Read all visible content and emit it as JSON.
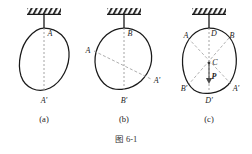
{
  "figure": {
    "caption": "图 6-1",
    "background_color": "#ffffff",
    "stroke_color": "#1a1a1a",
    "dash_color": "#8a8a8a",
    "width": 252,
    "height": 154
  },
  "panels": [
    {
      "id": "a",
      "caption": "(a)",
      "caption_x": 44,
      "caption_y": 114,
      "center_x": 44,
      "support": {
        "x": 44,
        "hatch_y": 8,
        "hatch_w": 34,
        "hatch_h": 6,
        "rod_top": 14,
        "rod_bottom": 28
      },
      "body_path": "M 44 28 C 58 28 68 38 69 52 C 70 66 62 82 50 88 C 38 94 25 88 21 76 C 17 63 21 46 29 37 C 34 31 39 28 44 28 Z",
      "axis": {
        "x1": 44,
        "y1": 28,
        "x2": 44,
        "y2": 90
      },
      "points": [
        {
          "label": "A",
          "x": 50,
          "y": 33
        },
        {
          "label": "A'",
          "x": 44,
          "y": 100
        }
      ]
    },
    {
      "id": "b",
      "caption": "(b)",
      "caption_x": 124,
      "caption_y": 114,
      "center_x": 124,
      "support": {
        "x": 124,
        "hatch_y": 8,
        "hatch_w": 34,
        "hatch_h": 6,
        "rod_top": 14,
        "rod_bottom": 28
      },
      "body_path": "M 124 28 C 136 28 146 35 150 47 C 154 60 150 72 141 81 C 131 90 116 92 107 86 C 97 79 93 65 96 52 C 100 38 111 28 124 28 Z",
      "axis": {
        "x1": 124,
        "y1": 28,
        "x2": 124,
        "y2": 90
      },
      "diagonal": {
        "x1": 94,
        "y1": 51,
        "x2": 151,
        "y2": 79
      },
      "points": [
        {
          "label": "B",
          "x": 130,
          "y": 33
        },
        {
          "label": "B'",
          "x": 124,
          "y": 100
        },
        {
          "label": "A",
          "x": 88,
          "y": 50
        },
        {
          "label": "A'",
          "x": 157,
          "y": 80
        }
      ]
    },
    {
      "id": "c",
      "caption": "(c)",
      "caption_x": 209,
      "caption_y": 114,
      "center_x": 209,
      "support": {
        "x": 209,
        "hatch_y": 8,
        "hatch_w": 34,
        "hatch_h": 6,
        "rod_top": 14,
        "rod_bottom": 28
      },
      "body_path": "M 209 28 C 222 28 232 36 235 49 C 238 62 236 76 228 85 C 219 94 203 96 194 90 C 185 83 181 68 183 54 C 186 39 196 28 209 28 Z",
      "axis": {
        "x1": 209,
        "y1": 28,
        "x2": 209,
        "y2": 92
      },
      "diagonals": [
        {
          "x1": 188,
          "y1": 38,
          "x2": 231,
          "y2": 84
        },
        {
          "x1": 229,
          "y1": 38,
          "x2": 189,
          "y2": 84
        }
      ],
      "force": {
        "x": 209,
        "y_from": 64,
        "y_to": 82,
        "label": "P"
      },
      "center_point": {
        "label": "C",
        "x": 215,
        "y": 62
      },
      "points": [
        {
          "label": "D",
          "x": 214,
          "y": 33
        },
        {
          "label": "A",
          "x": 186,
          "y": 35
        },
        {
          "label": "B",
          "x": 232,
          "y": 35
        },
        {
          "label": "B'",
          "x": 184,
          "y": 88
        },
        {
          "label": "A'",
          "x": 236,
          "y": 88
        },
        {
          "label": "D'",
          "x": 209,
          "y": 100
        }
      ]
    }
  ]
}
